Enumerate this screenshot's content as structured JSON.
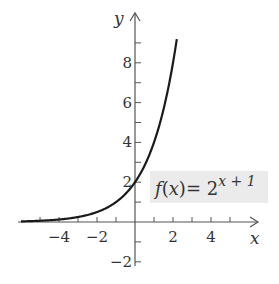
{
  "chart_data": {
    "type": "line",
    "title": "",
    "xlabel": "x",
    "ylabel": "y",
    "xlim": [
      -6,
      6
    ],
    "ylim": [
      -2,
      10
    ],
    "grid": false,
    "x_ticks": [
      -5,
      -4,
      -3,
      -2,
      -1,
      1,
      2,
      3,
      4,
      5
    ],
    "x_tick_labels": [
      "-4",
      "-2",
      "2",
      "4"
    ],
    "x_tick_label_values": [
      -4,
      -2,
      2,
      4
    ],
    "y_ticks": [
      -2,
      -1,
      1,
      2,
      3,
      4,
      5,
      6,
      7,
      8,
      9
    ],
    "y_tick_labels": [
      "-2",
      "2",
      "4",
      "6",
      "8"
    ],
    "y_tick_label_values": [
      -2,
      2,
      4,
      6,
      8
    ],
    "series": [
      {
        "name": "f(x) = 2^(x+1)",
        "function": "2^(x+1)",
        "x": [
          -6,
          -5,
          -4,
          -3,
          -2,
          -1,
          0,
          1,
          2,
          2.2
        ],
        "values": [
          0.03,
          0.06,
          0.125,
          0.25,
          0.5,
          1,
          2,
          4,
          8,
          9.19
        ]
      }
    ],
    "annotations": [
      {
        "text": "f(x) = 2^(x+1)",
        "base": "f(x)= 2",
        "exponent": "x + 1",
        "position": "right of y-axis near y=2"
      }
    ]
  },
  "labels": {
    "x_axis": "x",
    "y_axis": "y",
    "fn_prefix": "f",
    "fn_open": "(",
    "fn_var": "x",
    "fn_close": ")= 2",
    "fn_exponent": "x + 1"
  }
}
